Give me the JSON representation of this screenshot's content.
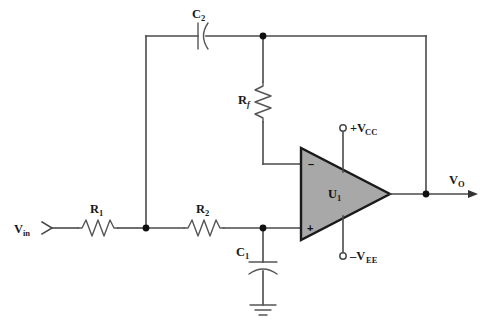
{
  "diagram": {
    "background_color": "#ffffff",
    "wire_color": "#4a4a4a",
    "opamp_fill_color": "#a8a8a8",
    "opamp_outline_color": "#1a1a1a",
    "node_color": "#111111"
  },
  "labels": {
    "input": {
      "base": "V",
      "sub": "in"
    },
    "output": {
      "base": "V",
      "sub": "O"
    },
    "r1": {
      "base": "R",
      "sub": "1"
    },
    "r2": {
      "base": "R",
      "sub": "2"
    },
    "rf": {
      "base": "R",
      "sub": "f"
    },
    "c1": {
      "base": "C",
      "sub": "1"
    },
    "c2": {
      "base": "C",
      "sub": "2"
    },
    "opamp": {
      "base": "U",
      "sub": "1"
    },
    "vcc": {
      "base": "+V",
      "sub": "CC"
    },
    "vee": {
      "base": "–V",
      "sub": "EE"
    },
    "pin_inverting": "–",
    "pin_noninverting": "+"
  },
  "components": [
    {
      "id": "R1",
      "type": "resistor",
      "name": "resistor-r1",
      "label": "R1"
    },
    {
      "id": "R2",
      "type": "resistor",
      "name": "resistor-r2",
      "label": "R2"
    },
    {
      "id": "Rf",
      "type": "resistor",
      "name": "resistor-rf",
      "label": "Rf"
    },
    {
      "id": "C1",
      "type": "capacitor",
      "name": "capacitor-c1",
      "label": "C1"
    },
    {
      "id": "C2",
      "type": "capacitor",
      "name": "capacitor-c2",
      "label": "C2"
    },
    {
      "id": "U1",
      "type": "op-amp",
      "name": "opamp-u1",
      "label": "U1"
    },
    {
      "id": "GND",
      "type": "ground",
      "name": "ground-symbol",
      "label": ""
    }
  ],
  "terminals": [
    {
      "id": "VIN",
      "name": "input-terminal-vin",
      "label": "Vin"
    },
    {
      "id": "VO",
      "name": "output-terminal-vo",
      "label": "VO"
    },
    {
      "id": "VCC",
      "name": "supply-terminal-vcc",
      "label": "+VCC"
    },
    {
      "id": "VEE",
      "name": "supply-terminal-vee",
      "label": "-VEE"
    }
  ],
  "nodes": [
    {
      "id": "N1",
      "name": "junction-node-input",
      "x": 146,
      "y": 228
    },
    {
      "id": "N2",
      "name": "junction-node-c1",
      "x": 263,
      "y": 228
    },
    {
      "id": "N3",
      "name": "junction-node-rf-top",
      "x": 263,
      "y": 36
    },
    {
      "id": "N4",
      "name": "junction-node-output",
      "x": 426,
      "y": 194
    }
  ]
}
